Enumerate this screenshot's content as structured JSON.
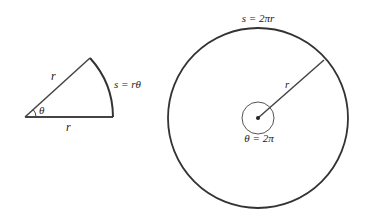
{
  "sector": {
    "radius_label_top": "r",
    "radius_label_bottom": "r",
    "angle_label": "θ",
    "arc_label": "s = rθ"
  },
  "circle": {
    "arc_label": "s = 2πr",
    "radius_label": "r",
    "angle_label": "θ = 2π"
  },
  "colors": {
    "stroke": "#333333",
    "background": "#ffffff"
  }
}
